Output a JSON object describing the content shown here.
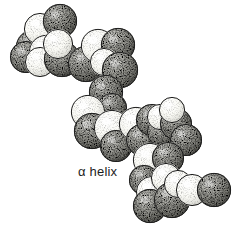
{
  "figure": {
    "kind": "space-filling-molecular-model",
    "caption": "α helix",
    "background_color": "#ffffff",
    "ink_color": "#1d1d1d",
    "width": 233,
    "height": 239,
    "style": "stippled pen-and-ink line drawing, black and white",
    "palette": {
      "light_sphere_fill": "#fbfbf7",
      "light_sphere_shade": "#cfcfca",
      "dark_sphere_fill": "#9a9a95",
      "dark_sphere_shade": "#4a4a46",
      "outline": "#1d1d1d",
      "stipple": "#2a2a27"
    }
  },
  "chart_data": {
    "type": "scatter",
    "title": "α helix",
    "xlabel": "",
    "ylabel": "",
    "xlim": [
      0,
      233
    ],
    "ylim": [
      0,
      239
    ],
    "grid": false,
    "legend": "none",
    "series": [
      {
        "name": "atoms",
        "points": [
          {
            "x": 33,
            "y": 47,
            "r": 17,
            "shade": "dark"
          },
          {
            "x": 26,
            "y": 57,
            "r": 16,
            "shade": "dark"
          },
          {
            "x": 40,
            "y": 29,
            "r": 16,
            "shade": "light"
          },
          {
            "x": 60,
            "y": 21,
            "r": 17,
            "shade": "dark"
          },
          {
            "x": 46,
            "y": 52,
            "r": 17,
            "shade": "light"
          },
          {
            "x": 40,
            "y": 62,
            "r": 15,
            "shade": "light"
          },
          {
            "x": 62,
            "y": 59,
            "r": 18,
            "shade": "dark"
          },
          {
            "x": 58,
            "y": 44,
            "r": 15,
            "shade": "light"
          },
          {
            "x": 86,
            "y": 64,
            "r": 18,
            "shade": "dark"
          },
          {
            "x": 98,
            "y": 46,
            "r": 17,
            "shade": "light"
          },
          {
            "x": 118,
            "y": 45,
            "r": 17,
            "shade": "dark"
          },
          {
            "x": 104,
            "y": 62,
            "r": 14,
            "shade": "light"
          },
          {
            "x": 120,
            "y": 70,
            "r": 18,
            "shade": "dark"
          },
          {
            "x": 106,
            "y": 92,
            "r": 17,
            "shade": "dark"
          },
          {
            "x": 112,
            "y": 108,
            "r": 15,
            "shade": "dark"
          },
          {
            "x": 88,
            "y": 112,
            "r": 17,
            "shade": "light"
          },
          {
            "x": 92,
            "y": 131,
            "r": 18,
            "shade": "dark"
          },
          {
            "x": 112,
            "y": 128,
            "r": 18,
            "shade": "light"
          },
          {
            "x": 116,
            "y": 146,
            "r": 16,
            "shade": "dark"
          },
          {
            "x": 136,
            "y": 124,
            "r": 17,
            "shade": "light"
          },
          {
            "x": 142,
            "y": 140,
            "r": 16,
            "shade": "dark"
          },
          {
            "x": 152,
            "y": 120,
            "r": 16,
            "shade": "dark"
          },
          {
            "x": 162,
            "y": 132,
            "r": 15,
            "shade": "dark"
          },
          {
            "x": 160,
            "y": 117,
            "r": 13,
            "shade": "light"
          },
          {
            "x": 176,
            "y": 124,
            "r": 16,
            "shade": "dark"
          },
          {
            "x": 172,
            "y": 110,
            "r": 13,
            "shade": "light"
          },
          {
            "x": 186,
            "y": 140,
            "r": 16,
            "shade": "dark"
          },
          {
            "x": 150,
            "y": 160,
            "r": 17,
            "shade": "light"
          },
          {
            "x": 168,
            "y": 158,
            "r": 16,
            "shade": "dark"
          },
          {
            "x": 144,
            "y": 180,
            "r": 15,
            "shade": "dark"
          },
          {
            "x": 152,
            "y": 192,
            "r": 16,
            "shade": "light"
          },
          {
            "x": 166,
            "y": 178,
            "r": 15,
            "shade": "light"
          },
          {
            "x": 150,
            "y": 206,
            "r": 17,
            "shade": "dark"
          },
          {
            "x": 172,
            "y": 200,
            "r": 18,
            "shade": "dark"
          },
          {
            "x": 178,
            "y": 184,
            "r": 14,
            "shade": "light"
          },
          {
            "x": 192,
            "y": 190,
            "r": 16,
            "shade": "light"
          },
          {
            "x": 214,
            "y": 190,
            "r": 17,
            "shade": "dark"
          }
        ]
      }
    ]
  }
}
